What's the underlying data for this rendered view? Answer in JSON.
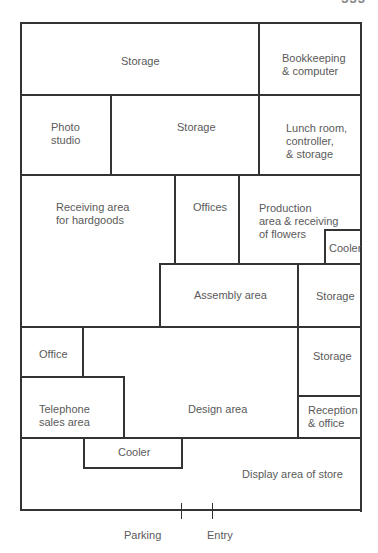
{
  "page_number": "333",
  "floor_plan": {
    "rooms": [
      {
        "id": "storage-top",
        "label": "Storage"
      },
      {
        "id": "bookkeeping",
        "label": "Bookkeeping\n& computer"
      },
      {
        "id": "photo-studio",
        "label": "Photo\nstudio"
      },
      {
        "id": "storage-middle",
        "label": "Storage"
      },
      {
        "id": "lunch-room",
        "label": "Lunch room,\ncontroller,\n& storage"
      },
      {
        "id": "receiving-hardgoods",
        "label": "Receiving area\nfor hardgoods"
      },
      {
        "id": "offices",
        "label": "Offices"
      },
      {
        "id": "production-area",
        "label": "Production\narea & receiving\nof flowers"
      },
      {
        "id": "cooler-production",
        "label": "Cooler"
      },
      {
        "id": "assembly-area",
        "label": "Assembly area"
      },
      {
        "id": "storage-right-1",
        "label": "Storage"
      },
      {
        "id": "office",
        "label": "Office"
      },
      {
        "id": "storage-right-2",
        "label": "Storage"
      },
      {
        "id": "telephone-sales",
        "label": "Telephone\nsales area"
      },
      {
        "id": "design-area",
        "label": "Design area"
      },
      {
        "id": "reception",
        "label": "Reception\n& office"
      },
      {
        "id": "cooler-display",
        "label": "Cooler"
      },
      {
        "id": "display-area",
        "label": "Display area of store"
      }
    ],
    "outside": {
      "parking": "Parking",
      "entry": "Entry"
    },
    "colors": {
      "wall": "#333333",
      "text": "#5a5a5a",
      "background": "#ffffff"
    }
  }
}
